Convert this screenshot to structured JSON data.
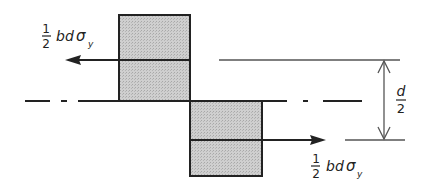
{
  "diagram": {
    "colors": {
      "stroke": "#222222",
      "fill": "#c8c8c8",
      "thin_line": "#555555",
      "background": "#ffffff"
    },
    "top_force_label": {
      "frac_num": "1",
      "frac_den": "2",
      "text": "bd",
      "sigma": "σ",
      "subscript": "y"
    },
    "bottom_force_label": {
      "frac_num": "1",
      "frac_den": "2",
      "text": "bd",
      "sigma": "σ",
      "subscript": "y"
    },
    "dimension_label": {
      "num": "d",
      "den": "2"
    },
    "elements": {
      "compression_block": "upper stress block",
      "tension_block": "lower stress block",
      "neutral_axis": "centre line (dash-dot)",
      "left_force_arrow": "resultant force pointing left",
      "right_force_arrow": "resultant force pointing right",
      "lever_arm_dimension": "d/2"
    }
  }
}
